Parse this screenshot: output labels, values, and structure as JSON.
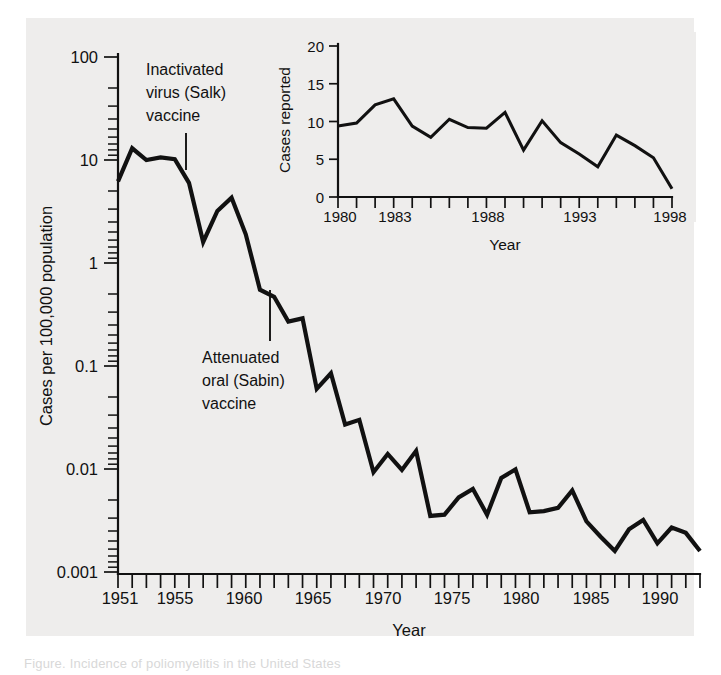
{
  "figure": {
    "background_color": "#eeedec",
    "line_color": "#111111",
    "caption_partial": "Figure. Incidence of poliomyelitis in the United States"
  },
  "chart_data": [
    {
      "id": "main",
      "type": "line",
      "title": "",
      "xlabel": "Year",
      "ylabel": "Cases per 100,000 population",
      "yscale": "log",
      "ylim": [
        0.001,
        100
      ],
      "xlim": [
        1951,
        1992
      ],
      "ytick_labels": [
        "100",
        "10",
        "1",
        "0.1",
        "0.01",
        "0.001"
      ],
      "ytick_values": [
        100,
        10,
        1,
        0.1,
        0.01,
        0.001
      ],
      "xtick_labels": [
        "1951",
        "1955",
        "1960",
        "1965",
        "1970",
        "1975",
        "1980",
        "1985",
        "1990"
      ],
      "xtick_values": [
        1951,
        1955,
        1960,
        1965,
        1970,
        1975,
        1980,
        1985,
        1990
      ],
      "grid": false,
      "legend": "none",
      "x": [
        1951,
        1952,
        1953,
        1954,
        1955,
        1956,
        1957,
        1958,
        1959,
        1960,
        1961,
        1962,
        1963,
        1964,
        1965,
        1966,
        1967,
        1968,
        1969,
        1970,
        1971,
        1972,
        1973,
        1974,
        1975,
        1976,
        1977,
        1978,
        1979,
        1980,
        1981,
        1982,
        1983,
        1984,
        1985,
        1986,
        1987,
        1988,
        1989,
        1990,
        1991,
        1992
      ],
      "values": [
        6.2,
        13.0,
        10.0,
        10.6,
        10.2,
        6.0,
        1.6,
        3.2,
        4.3,
        1.9,
        0.55,
        0.47,
        0.27,
        0.29,
        0.06,
        0.085,
        0.027,
        0.03,
        0.0093,
        0.014,
        0.0098,
        0.015,
        0.0035,
        0.0036,
        0.0053,
        0.0064,
        0.0036,
        0.0082,
        0.0099,
        0.0038,
        0.0039,
        0.0042,
        0.0062,
        0.0031,
        0.0022,
        0.0016,
        0.0026,
        0.0032,
        0.0019,
        0.0027,
        0.0024,
        0.0016
      ],
      "annotations": [
        {
          "text": "Inactivated virus (Salk) vaccine",
          "lines": [
            "Inactivated",
            "virus (Salk)",
            "vaccine"
          ],
          "points_to_year": 1955
        },
        {
          "text": "Attenuated oral (Sabin) vaccine",
          "lines": [
            "Attenuated",
            "oral (Sabin)",
            "vaccine"
          ],
          "points_to_year": 1961
        }
      ]
    },
    {
      "id": "inset",
      "type": "line",
      "title": "",
      "xlabel": "Year",
      "ylabel": "Cases reported",
      "yscale": "linear",
      "ylim": [
        0,
        20
      ],
      "xlim": [
        1980,
        1998
      ],
      "ytick_labels": [
        "20",
        "15",
        "10",
        "5",
        "0"
      ],
      "ytick_values": [
        20,
        15,
        10,
        5,
        0
      ],
      "xtick_labels": [
        "1980",
        "1983",
        "1988",
        "1993",
        "1998"
      ],
      "xtick_values": [
        1980,
        1983,
        1988,
        1993,
        1998
      ],
      "grid": false,
      "legend": "none",
      "x": [
        1980,
        1981,
        1982,
        1983,
        1984,
        1985,
        1986,
        1987,
        1988,
        1989,
        1990,
        1991,
        1992,
        1993,
        1994,
        1995,
        1996,
        1997,
        1998
      ],
      "values": [
        9.4,
        9.8,
        12.2,
        13.0,
        9.4,
        7.9,
        10.3,
        9.2,
        9.1,
        11.2,
        6.2,
        10.1,
        7.2,
        5.7,
        4.0,
        8.2,
        6.8,
        5.2,
        1.1
      ]
    }
  ]
}
